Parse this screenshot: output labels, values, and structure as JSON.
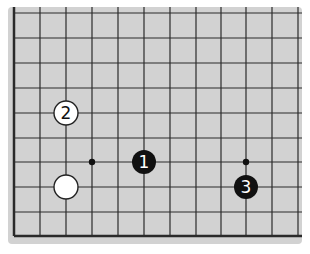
{
  "diagram": {
    "type": "go-board-fragment",
    "board_color": "#d2d2d2",
    "line_color": "#2a2a2a",
    "board_rect": {
      "x": 8,
      "y": 7,
      "w": 294,
      "h": 237
    },
    "grid": {
      "x_lines": [
        14,
        40,
        66,
        92,
        118,
        144,
        170,
        196,
        221,
        246,
        272,
        298
      ],
      "y_lines": [
        13,
        38,
        63,
        88,
        113,
        138,
        162,
        187,
        212,
        236
      ],
      "edges": {
        "left": true,
        "bottom": true,
        "top": false,
        "right": false
      }
    },
    "star_points": [
      {
        "col": 3,
        "row": 6
      },
      {
        "col": 9,
        "row": 6
      }
    ],
    "stones": [
      {
        "color": "black",
        "label": "1",
        "col": 5,
        "row": 6
      },
      {
        "color": "white",
        "label": "2",
        "col": 2,
        "row": 4
      },
      {
        "color": "black",
        "label": "3",
        "col": 9,
        "row": 7
      },
      {
        "color": "white",
        "label": "",
        "col": 2,
        "row": 7
      }
    ],
    "stone_radius": 12
  }
}
